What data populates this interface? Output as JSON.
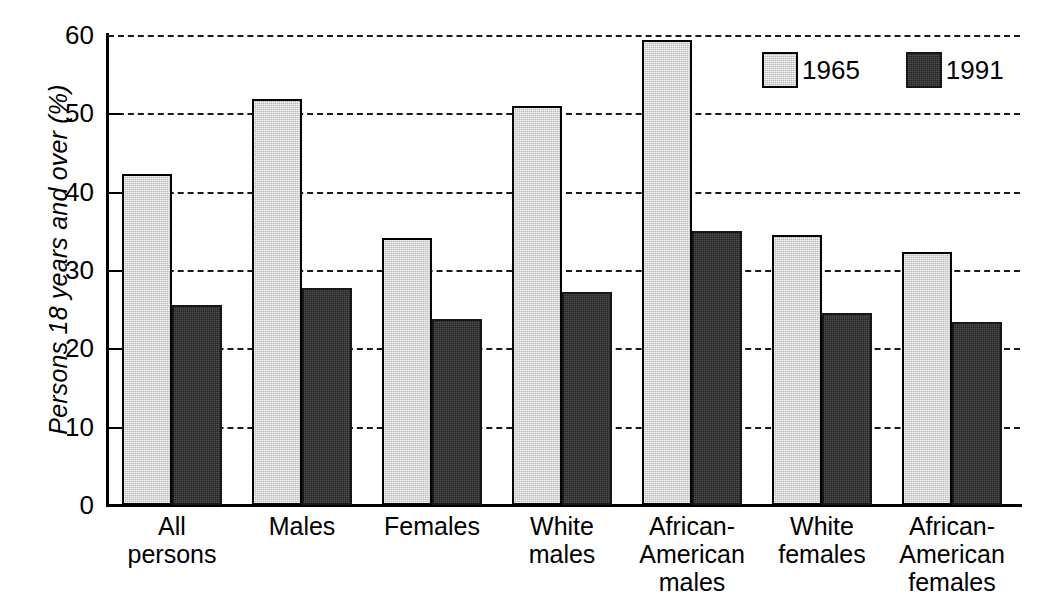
{
  "chart_data": {
    "type": "bar",
    "title": "",
    "xlabel": "",
    "ylabel": "Persons 18 years and over (%)",
    "ylim": [
      0,
      60
    ],
    "yticks": [
      0,
      10,
      20,
      30,
      40,
      50,
      60
    ],
    "ytick_labels": [
      "0",
      "10",
      "20",
      "30",
      "40",
      "50",
      "60"
    ],
    "grid": "horizontal-dashed",
    "legend_position": "top-right",
    "categories": [
      "All\npersons",
      "Males",
      "Females",
      "White\nmales",
      "African-\nAmerican\nmales",
      "White\nfemales",
      "African-\nAmerican\nfemales"
    ],
    "series": [
      {
        "name": "1965",
        "color": "#bdbdbd",
        "values": [
          42.3,
          51.8,
          34.1,
          51.0,
          59.4,
          34.5,
          32.3
        ]
      },
      {
        "name": "1991",
        "color": "#262626",
        "values": [
          25.5,
          27.7,
          23.8,
          27.2,
          35.0,
          24.5,
          23.4
        ]
      }
    ]
  },
  "legend": {
    "items": [
      {
        "label": "1965",
        "series_key": "s1965"
      },
      {
        "label": "1991",
        "series_key": "s1991"
      }
    ]
  },
  "colors": {
    "series_1965": "#bdbdbd",
    "series_1991": "#262626",
    "axis": "#000000",
    "gridline": "#1a1a1a",
    "background": "#ffffff"
  }
}
